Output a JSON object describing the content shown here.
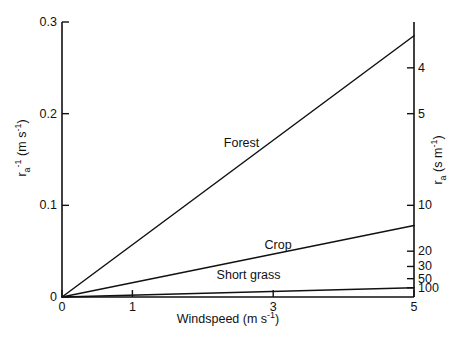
{
  "chart_data": {
    "type": "line",
    "title": "",
    "xlabel": "Windspeed (m s-1)",
    "ylabel": "ra-1 (m s-1)",
    "ylabel_right": "ra (s m-1)",
    "xlim": [
      0,
      5
    ],
    "ylim": [
      0,
      0.3
    ],
    "grid": false,
    "legend_position": "inline-labels",
    "x_ticks": [
      {
        "value": 0,
        "label": "0"
      },
      {
        "value": 1,
        "label": "1"
      },
      {
        "value": 3,
        "label": "3"
      },
      {
        "value": 5,
        "label": "5"
      }
    ],
    "y_ticks_left": [
      {
        "value": 0,
        "label": "0"
      },
      {
        "value": 0.1,
        "label": "0.1"
      },
      {
        "value": 0.2,
        "label": "0.2"
      },
      {
        "value": 0.3,
        "label": "0.3"
      }
    ],
    "y_ticks_right": [
      {
        "resistance": 4,
        "conductance": 0.25,
        "label": "4"
      },
      {
        "resistance": 5,
        "conductance": 0.2,
        "label": "5"
      },
      {
        "resistance": 10,
        "conductance": 0.1,
        "label": "10"
      },
      {
        "resistance": 20,
        "conductance": 0.05,
        "label": "20"
      },
      {
        "resistance": 30,
        "conductance": 0.0333,
        "label": "30"
      },
      {
        "resistance": 50,
        "conductance": 0.02,
        "label": "50"
      },
      {
        "resistance": 100,
        "conductance": 0.01,
        "label": "100"
      }
    ],
    "series": [
      {
        "name": "Forest",
        "x": [
          0,
          5
        ],
        "values": [
          0,
          0.285
        ],
        "label_x": 2.55,
        "label_y": 0.168
      },
      {
        "name": "Crop",
        "x": [
          0,
          5
        ],
        "values": [
          0,
          0.078
        ],
        "label_x": 3.07,
        "label_y": 0.0565
      },
      {
        "name": "Short grass",
        "x": [
          0,
          5
        ],
        "values": [
          0,
          0.01
        ],
        "label_x": 2.65,
        "label_y": 0.0245
      }
    ]
  },
  "labels": {
    "x_title_main": "Windspeed (m s",
    "x_title_sup": "-1",
    "x_title_tail": ")",
    "y_left_r": "r",
    "y_left_sub": "a",
    "y_left_sup": "-1",
    "y_left_unit_open": " (m s",
    "y_left_unit_sup": "-1",
    "y_left_unit_close": ")",
    "y_right_r": "r",
    "y_right_sub": "a",
    "y_right_unit_open": " (s m",
    "y_right_unit_sup": "-1",
    "y_right_unit_close": ")"
  },
  "style": {
    "line_color": "#111111",
    "axis_color": "#111111",
    "background": "#ffffff"
  }
}
